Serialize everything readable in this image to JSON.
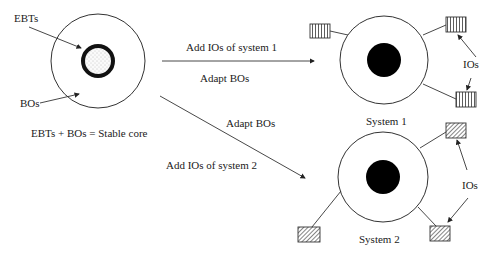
{
  "diagram": {
    "core": {
      "ebts_label": "EBTs",
      "bos_label": "BOs",
      "caption": "EBTs + BOs = Stable core"
    },
    "arrows": {
      "to_system1_top": "Add IOs of system 1",
      "to_system1_bottom": "Adapt BOs",
      "to_system2_top": "Adapt BOs",
      "to_system2_bottom": "Add IOs of system 2"
    },
    "system1": {
      "label": "System 1",
      "ios_label": "IOs",
      "io_style": "vertical-stripes"
    },
    "system2": {
      "label": "System 2",
      "ios_label": "IOs",
      "io_style": "diagonal-hatch"
    }
  }
}
